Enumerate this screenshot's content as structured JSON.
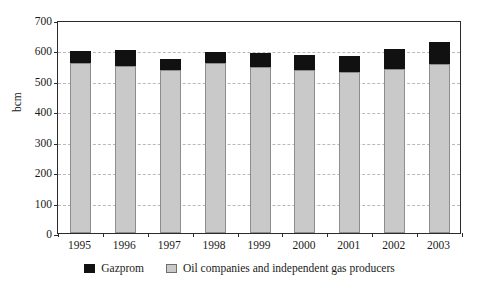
{
  "chart_data": {
    "type": "bar",
    "title": "",
    "subtitle": "",
    "xlabel": "",
    "ylabel": "bcm",
    "stacked": true,
    "grid": true,
    "legend_position": "bottom-center",
    "ylim": [
      0,
      700
    ],
    "yticks": [
      0,
      100,
      200,
      300,
      400,
      500,
      600,
      700
    ],
    "ytick_labels": [
      "0",
      "100",
      "200",
      "300",
      "400",
      "500",
      "600",
      "700"
    ],
    "categories": [
      "1995",
      "1996",
      "1997",
      "1998",
      "1999",
      "2000",
      "2001",
      "2002",
      "2003"
    ],
    "series": [
      {
        "name": "Oil companies and independent gas producers",
        "color": "#c9c9c9",
        "values": [
          560,
          548,
          537,
          558,
          546,
          537,
          528,
          540,
          555
        ]
      },
      {
        "name": "Gazprom",
        "color": "#111111",
        "values": [
          37,
          55,
          34,
          38,
          46,
          48,
          54,
          66,
          73
        ]
      }
    ],
    "totals": [
      597,
      603,
      571,
      596,
      592,
      585,
      582,
      606,
      628
    ]
  },
  "legend": {
    "items": [
      {
        "label": "Gazprom",
        "swatch": "black-swatch-icon"
      },
      {
        "label": "Oil companies and independent gas producers",
        "swatch": "gray-swatch-icon"
      }
    ]
  },
  "axis": {
    "y_title": "bcm"
  },
  "colors": {
    "gazprom": "#111111",
    "others": "#c9c9c9",
    "frame": "#2a2a2a",
    "grid": "#b9b9b9",
    "background": "#ffffff"
  }
}
